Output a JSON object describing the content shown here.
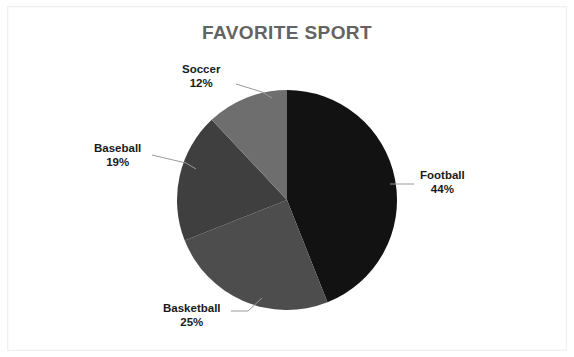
{
  "chart_data": {
    "type": "pie",
    "title": "FAVORITE SPORT",
    "xlabel": "",
    "ylabel": "",
    "legend_position": "none",
    "grid": false,
    "labels_show_percent": true,
    "start_angle_deg": 0,
    "direction": "clockwise",
    "categories": [
      "Football",
      "Basketball",
      "Baseball",
      "Soccer"
    ],
    "values": [
      44,
      25,
      19,
      12
    ],
    "slices": [
      {
        "name": "Football",
        "percent_label": "44%",
        "value": 44,
        "color": "#121212"
      },
      {
        "name": "Basketball",
        "percent_label": "25%",
        "value": 25,
        "color": "#4d4d4d"
      },
      {
        "name": "Baseball",
        "percent_label": "19%",
        "value": 19,
        "color": "#3f3f3f"
      },
      {
        "name": "Soccer",
        "percent_label": "12%",
        "value": 12,
        "color": "#6e6e6e"
      }
    ]
  },
  "title": {
    "text": "FAVORITE SPORT",
    "color": "#636363"
  },
  "labels": {
    "football": {
      "name": "Football",
      "percent": "44%"
    },
    "basketball": {
      "name": "Basketball",
      "percent": "25%"
    },
    "baseball": {
      "name": "Baseball",
      "percent": "19%"
    },
    "soccer": {
      "name": "Soccer",
      "percent": "12%"
    }
  },
  "colors": {
    "background": "#ffffff",
    "frame": "#f0f0f0",
    "leader_line": "#9a9a9a",
    "label_text": "#1a1a1a"
  }
}
